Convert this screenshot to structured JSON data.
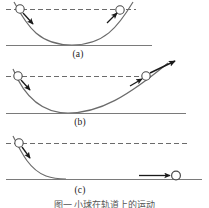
{
  "figure": {
    "background_color": "#ffffff",
    "stroke_color": "#595959",
    "ink_color": "#1a1a1a",
    "caption": "图一    小球在轨道上的运动",
    "panels": [
      {
        "id": "a",
        "label": "(a)",
        "track_shape": "symmetric-valley",
        "description": "Ball released on left side of a symmetric curved valley rises to the same height on the right side",
        "dashed_reference_line": "equal height level",
        "balls": [
          {
            "position": "left-upper",
            "x": 20,
            "y": 9,
            "radius": 4
          },
          {
            "position": "right-upper",
            "x": 120,
            "y": 10,
            "radius": 4
          }
        ],
        "arrows": [
          {
            "name": "left-velocity-arrow",
            "direction": "down-right"
          },
          {
            "name": "right-velocity-arrow",
            "direction": "up-right"
          }
        ],
        "ground_line": true
      },
      {
        "id": "b",
        "label": "(b)",
        "track_shape": "asymmetric-valley-shallow-right",
        "description": "Ball released on left side travels through the valley and leaves along a longer shallower right ramp at the same height",
        "dashed_reference_line": "equal height level",
        "balls": [
          {
            "position": "left-upper",
            "x": 18,
            "y": 76,
            "radius": 4
          },
          {
            "position": "right-ramp",
            "x": 146,
            "y": 76,
            "radius": 4
          }
        ],
        "arrows": [
          {
            "name": "left-velocity-arrow",
            "direction": "down-right"
          },
          {
            "name": "right-velocity-arrow",
            "direction": "up-right"
          },
          {
            "name": "exit-velocity-arrow",
            "direction": "up-right-long"
          }
        ],
        "ground_line": true
      },
      {
        "id": "c",
        "label": "(c)",
        "track_shape": "ramp-to-flat",
        "description": "Ball released on a steep left ramp descends onto a flat horizontal track and rolls to the right at constant speed",
        "dashed_reference_line": "release height level",
        "balls": [
          {
            "position": "left-upper",
            "x": 19,
            "y": 143,
            "radius": 4
          },
          {
            "position": "right-flat",
            "x": 176,
            "y": 176,
            "radius": 4
          }
        ],
        "arrows": [
          {
            "name": "left-velocity-arrow",
            "direction": "down-right"
          },
          {
            "name": "flat-velocity-arrow",
            "direction": "right-horizontal"
          }
        ],
        "ground_line": true
      }
    ]
  }
}
